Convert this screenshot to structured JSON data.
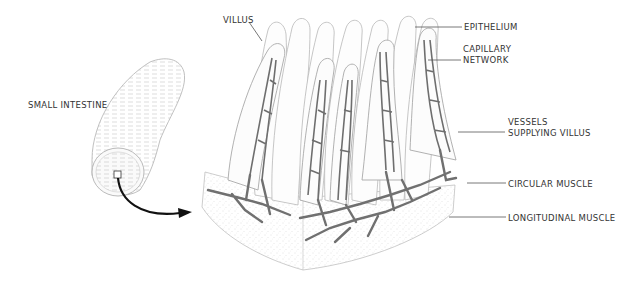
{
  "diagram": {
    "labels": {
      "small_intestine": "SMALL INTESTINE",
      "villus": "VILLUS",
      "epithelium": "EPITHELIUM",
      "capillary_network_line1": "CAPILLARY",
      "capillary_network_line2": "NETWORK",
      "vessels_line1": "VESSELS",
      "vessels_line2": "SUPPLYING VILLUS",
      "circular_muscle": "CIRCULAR MUSCLE",
      "longitudinal_muscle": "LONGITUDINAL MUSCLE"
    },
    "colors": {
      "vessel": "#6e6e6e",
      "outline": "#b5b5b5",
      "stipple": "#cfcfcf",
      "arrow": "#111111",
      "leader": "#555555"
    }
  }
}
